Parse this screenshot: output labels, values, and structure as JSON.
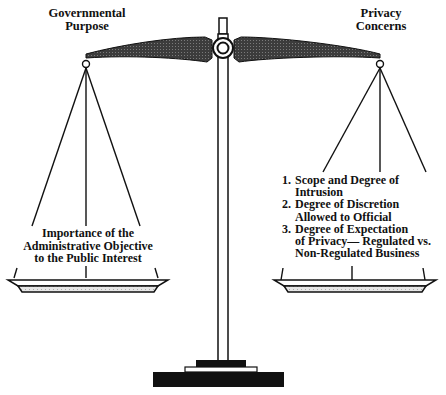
{
  "diagram": {
    "type": "balance-scale",
    "left_side": {
      "title_line1": "Governmental",
      "title_line2": "Purpose",
      "pan_text_line1": "Importance of the",
      "pan_text_line2": "Administrative Objective",
      "pan_text_line3": "to the Public Interest"
    },
    "right_side": {
      "title_line1": "Privacy",
      "title_line2": "Concerns",
      "items": [
        {
          "num": "1.",
          "line1": "Scope and Degree of",
          "line2": "Intrusion"
        },
        {
          "num": "2.",
          "line1": "Degree of Discretion",
          "line2": "Allowed to Official"
        },
        {
          "num": "3.",
          "line1": "Degree of Expectation",
          "line2": "of Privacy— Regulated vs.",
          "line3": "Non-Regulated Business"
        }
      ]
    },
    "colors": {
      "ink": "#111111",
      "beam_fill": "#3a3a3a",
      "pan_fill": "#d9d9d9",
      "background": "#ffffff"
    }
  }
}
